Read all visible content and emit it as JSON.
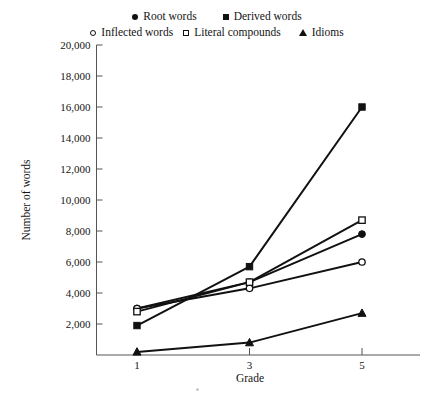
{
  "chart_data": {
    "type": "line",
    "title": "",
    "xlabel": "Grade",
    "ylabel": "Number of words",
    "x": [
      1,
      3,
      5
    ],
    "categories": [
      "1",
      "3",
      "5"
    ],
    "xtick_labels": [
      "1",
      "3",
      "5"
    ],
    "ytick_labels": [
      "2,000",
      "4,000",
      "6,000",
      "8,000",
      "10,000",
      "12,000",
      "14,000",
      "16,000",
      "18,000",
      "20,000"
    ],
    "ytick_values": [
      2000,
      4000,
      6000,
      8000,
      10000,
      12000,
      14000,
      16000,
      18000,
      20000
    ],
    "ylim": [
      0,
      20000
    ],
    "xlim": [
      0,
      6
    ],
    "grid": false,
    "legend_position": "top-center",
    "series": [
      {
        "name": "Root words",
        "marker": "filled-circle",
        "values": [
          3000,
          4700,
          7800
        ]
      },
      {
        "name": "Derived words",
        "marker": "filled-square",
        "values": [
          1900,
          5700,
          16000
        ]
      },
      {
        "name": "Inflected words",
        "marker": "open-circle",
        "values": [
          3000,
          4300,
          6000
        ]
      },
      {
        "name": "Literal compounds",
        "marker": "open-square",
        "values": [
          2800,
          4700,
          8700
        ]
      },
      {
        "name": "Idioms",
        "marker": "triangle",
        "values": [
          200,
          800,
          2700
        ]
      }
    ]
  },
  "legend": {
    "rows": [
      [
        {
          "label": "Root words",
          "marker": "filled-circle"
        },
        {
          "label": "Derived words",
          "marker": "filled-square"
        }
      ],
      [
        {
          "label": "Inflected words",
          "marker": "open-circle"
        },
        {
          "label": "Literal compounds",
          "marker": "open-square"
        },
        {
          "label": "Idioms",
          "marker": "triangle"
        }
      ]
    ]
  },
  "axes": {
    "y_title": "Number of words",
    "x_title": "Grade"
  }
}
